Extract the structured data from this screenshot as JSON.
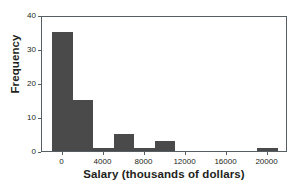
{
  "chart_data": {
    "type": "bar",
    "title": "",
    "subtitle": "",
    "xlabel": "Salary (thousands of dollars)",
    "ylabel": "Frequency",
    "xlim": [
      -2000,
      22000
    ],
    "ylim": [
      0,
      40
    ],
    "grid": false,
    "legend": null,
    "bin_width": 2000,
    "bar_color": "#4a4a4a",
    "axis_color": "#555f63",
    "xticks": [
      0,
      4000,
      8000,
      12000,
      16000,
      20000
    ],
    "xtick_labels": [
      "0",
      "4000",
      "8000",
      "12000",
      "16000",
      "20000"
    ],
    "yticks": [
      0,
      10,
      20,
      30,
      40
    ],
    "ytick_labels": [
      "0",
      "10",
      "20",
      "30",
      "40"
    ],
    "bins": [
      {
        "left": -1000,
        "right": 1000,
        "value": 35
      },
      {
        "left": 1000,
        "right": 3000,
        "value": 15
      },
      {
        "left": 3000,
        "right": 5000,
        "value": 1
      },
      {
        "left": 5000,
        "right": 7000,
        "value": 5
      },
      {
        "left": 7000,
        "right": 9000,
        "value": 1
      },
      {
        "left": 9000,
        "right": 11000,
        "value": 3
      },
      {
        "left": 11000,
        "right": 13000,
        "value": 0
      },
      {
        "left": 13000,
        "right": 15000,
        "value": 0
      },
      {
        "left": 15000,
        "right": 17000,
        "value": 0
      },
      {
        "left": 17000,
        "right": 19000,
        "value": 0
      },
      {
        "left": 19000,
        "right": 21000,
        "value": 1
      }
    ]
  }
}
